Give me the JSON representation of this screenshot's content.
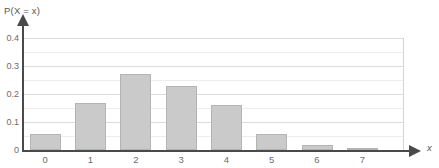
{
  "chart_data": {
    "type": "bar",
    "title": "",
    "xlabel": "x",
    "ylabel": "P(X = x)",
    "categories": [
      "0",
      "1",
      "2",
      "3",
      "4",
      "5",
      "6",
      "7"
    ],
    "values": [
      0.057,
      0.167,
      0.27,
      0.23,
      0.16,
      0.057,
      0.018,
      0.006
    ],
    "ylim": [
      0,
      0.4
    ],
    "xlim": [
      -0.5,
      7.8
    ],
    "y_ticks": [
      "0",
      "0.1",
      "0.2",
      "0.3",
      "0.4"
    ],
    "y_tick_values": [
      0,
      0.1,
      0.2,
      0.3,
      0.4
    ],
    "x_ticks": [
      "0",
      "1",
      "2",
      "3",
      "4",
      "5",
      "6",
      "7"
    ],
    "grid": "horizontal",
    "legend": "none",
    "bar_color": "#cacaca",
    "bar_border_color": "#b4b4b4",
    "axis_color": "#4a4a4a",
    "gridline_color": "#dcdcdc",
    "tick_label_color": "#6b6c70"
  }
}
